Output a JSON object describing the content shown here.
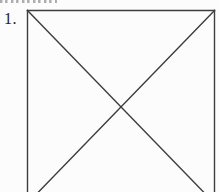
{
  "page": {
    "background_color": "#fcfcfc",
    "width": 220,
    "height": 192
  },
  "exercise": {
    "number_label": "1."
  },
  "figure": {
    "stroke_color": "#3d3d3d",
    "stroke_width": 1.4,
    "lines": [
      {
        "name": "square-top-edge",
        "x1": 27.5,
        "y1": 10.5,
        "x2": 214.5,
        "y2": 10.5
      },
      {
        "name": "square-left-edge",
        "x1": 27.5,
        "y1": 10.5,
        "x2": 27.5,
        "y2": 192
      },
      {
        "name": "square-right-edge",
        "x1": 214.5,
        "y1": 10.5,
        "x2": 214.5,
        "y2": 192
      },
      {
        "name": "diagonal-topleft-bottomright",
        "x1": 27.5,
        "y1": 10.5,
        "x2": 203.5,
        "y2": 192
      },
      {
        "name": "diagonal-topright-bottomleft",
        "x1": 214.5,
        "y1": 10.5,
        "x2": 38.5,
        "y2": 192
      }
    ]
  }
}
